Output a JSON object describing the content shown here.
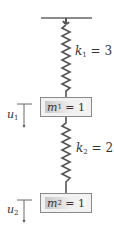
{
  "diagram": {
    "title": "",
    "ceiling": {
      "x1": 41,
      "x2": 92,
      "y": 18
    },
    "springs": [
      {
        "name": "k_1",
        "symbol": "k",
        "sub": "1",
        "value": "3",
        "label": "k1 = 3"
      },
      {
        "name": "k_2",
        "symbol": "k",
        "sub": "2",
        "value": "2",
        "label": "k2 = 2"
      }
    ],
    "masses": [
      {
        "name": "m_1",
        "symbol": "m",
        "sub": "1",
        "value": "1",
        "label": "m1 = 1"
      },
      {
        "name": "m_2",
        "symbol": "m",
        "sub": "2",
        "value": "1",
        "label": "m2 = 1"
      }
    ],
    "displacements": [
      {
        "symbol": "u",
        "sub": "1",
        "label": "u1",
        "direction": "down"
      },
      {
        "symbol": "u",
        "sub": "2",
        "label": "u2",
        "direction": "down"
      }
    ],
    "colors": {
      "line": "#555555",
      "spring": "#555555",
      "mass_fill": "#e6e6e6",
      "text": "#333333"
    }
  }
}
